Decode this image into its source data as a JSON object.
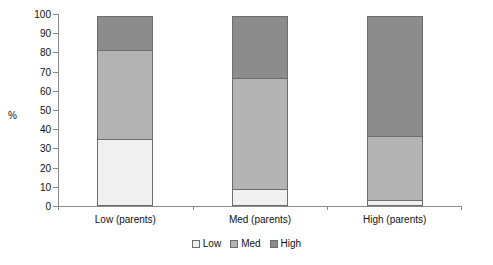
{
  "chart_data": {
    "type": "bar",
    "subtype": "stacked-bar-100",
    "title": "",
    "xlabel": "",
    "ylabel": "%",
    "ylim": [
      0,
      100
    ],
    "yticks": [
      0,
      10,
      20,
      30,
      40,
      50,
      60,
      70,
      80,
      90,
      100
    ],
    "grid": false,
    "legend_position": "bottom",
    "categories": [
      "Low (parents)",
      "Med (parents)",
      "High (parents)"
    ],
    "series": [
      {
        "name": "Low",
        "values": [
          35,
          9,
          3
        ],
        "color": "#f0f0f0"
      },
      {
        "name": "Med",
        "values": [
          47,
          58,
          34
        ],
        "color": "#b3b3b3"
      },
      {
        "name": "High",
        "values": [
          18,
          33,
          63
        ],
        "color": "#8c8c8c"
      }
    ],
    "cumulative_tops": [
      {
        "category": "Low (parents)",
        "low_top": 35,
        "med_top": 82,
        "high_top": 100
      },
      {
        "category": "Med (parents)",
        "low_top": 9,
        "med_top": 67,
        "high_top": 100
      },
      {
        "category": "High (parents)",
        "low_top": 3,
        "med_top": 37,
        "high_top": 100
      }
    ]
  },
  "axis": {
    "y_title": "%",
    "tick_labels": [
      "100",
      "90",
      "80",
      "70",
      "60",
      "50",
      "40",
      "30",
      "20",
      "10",
      "0"
    ]
  },
  "categories": {
    "labels": [
      "Low (parents)",
      "Med (parents)",
      "High (parents)"
    ]
  },
  "legend": {
    "items": [
      {
        "label": "Low"
      },
      {
        "label": "Med"
      },
      {
        "label": "High"
      }
    ]
  },
  "colors": {
    "low": "#f0f0f0",
    "med": "#b3b3b3",
    "high": "#8c8c8c",
    "outline": "#6e6e6e",
    "axis": "#8a8a8a",
    "text": "#111111",
    "background": "#ffffff"
  }
}
